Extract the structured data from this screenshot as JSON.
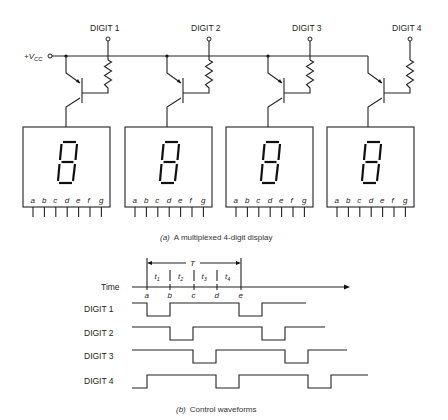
{
  "circuit": {
    "supply_label": "+V",
    "supply_subscript": "CC",
    "digits": [
      {
        "label": "DIGIT 1",
        "displayed": "8"
      },
      {
        "label": "DIGIT 2",
        "displayed": "8"
      },
      {
        "label": "DIGIT 3",
        "displayed": "8"
      },
      {
        "label": "DIGIT 4",
        "displayed": "8"
      }
    ],
    "segment_pins": [
      "a",
      "b",
      "c",
      "d",
      "e",
      "f",
      "g"
    ],
    "caption_prefix": "(a)",
    "caption": "A multiplexed 4-digit display"
  },
  "timing": {
    "axis_label": "Time",
    "period_label": "T",
    "intervals": [
      "t1",
      "t2",
      "t3",
      "t4"
    ],
    "interval_subscripts": [
      "1",
      "2",
      "3",
      "4"
    ],
    "time_marks": [
      "a",
      "b",
      "c",
      "d",
      "e"
    ],
    "waveforms": [
      {
        "label": "DIGIT 1",
        "levels": [
          1,
          0,
          1,
          1,
          1,
          0,
          1,
          1
        ]
      },
      {
        "label": "DIGIT 2",
        "levels": [
          1,
          1,
          0,
          1,
          1,
          1,
          0,
          1
        ]
      },
      {
        "label": "DIGIT 3",
        "levels": [
          1,
          1,
          1,
          0,
          1,
          1,
          1,
          0
        ]
      },
      {
        "label": "DIGIT 4",
        "levels": [
          0,
          1,
          1,
          1,
          0,
          1,
          1,
          1
        ]
      }
    ],
    "level_meaning": {
      "high": 1,
      "low": 0
    },
    "caption_prefix": "(b)",
    "caption": "Control waveforms"
  }
}
